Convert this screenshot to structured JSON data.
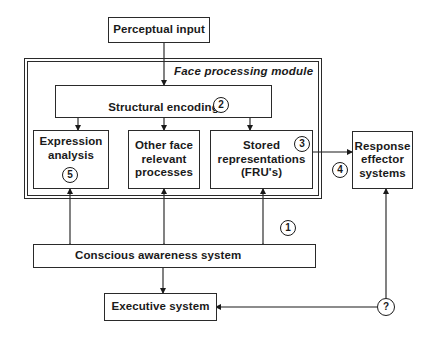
{
  "diagram": {
    "title": "Face processing module",
    "nodes": {
      "perceptual_input": {
        "label": "Perceptual input"
      },
      "structural_encoding": {
        "label": "Structural encoding",
        "badge": "2"
      },
      "expression_analysis": {
        "label_lines": [
          "Expression",
          "analysis"
        ],
        "badge": "5"
      },
      "other_face": {
        "label_lines": [
          "Other face",
          "relevant",
          "processes"
        ]
      },
      "stored_representations": {
        "label_lines": [
          "Stored",
          "representations",
          "(FRU's)"
        ],
        "badge": "3"
      },
      "response_effector": {
        "label_lines": [
          "Response",
          "effector",
          "systems"
        ]
      },
      "conscious_awareness": {
        "label": "Conscious awareness system"
      },
      "executive_system": {
        "label": "Executive system"
      }
    },
    "badges": {
      "b1": "1",
      "b4": "4",
      "b_question": "?"
    },
    "edges": [
      {
        "from": "Perceptual input",
        "to": "Structural encoding",
        "type": "arrow"
      },
      {
        "from": "Structural encoding",
        "to": "Expression analysis",
        "type": "arrow"
      },
      {
        "from": "Structural encoding",
        "to": "Other face relevant processes",
        "type": "arrow"
      },
      {
        "from": "Structural encoding",
        "to": "Stored representations (FRU's)",
        "type": "arrow"
      },
      {
        "from": "Stored representations (FRU's)",
        "to": "Response effector systems",
        "type": "arrow",
        "badge": "4"
      },
      {
        "from": "Expression analysis",
        "to": "Conscious awareness system",
        "type": "bidirectional"
      },
      {
        "from": "Other face relevant processes",
        "to": "Conscious awareness system",
        "type": "bidirectional"
      },
      {
        "from": "Stored representations (FRU's)",
        "to": "Conscious awareness system",
        "type": "bidirectional",
        "badge": "1"
      },
      {
        "from": "Conscious awareness system",
        "to": "Executive system",
        "type": "bidirectional"
      },
      {
        "from": "?",
        "to": "Executive system",
        "type": "arrow"
      },
      {
        "from": "?",
        "to": "Response effector systems",
        "type": "arrow"
      }
    ]
  }
}
